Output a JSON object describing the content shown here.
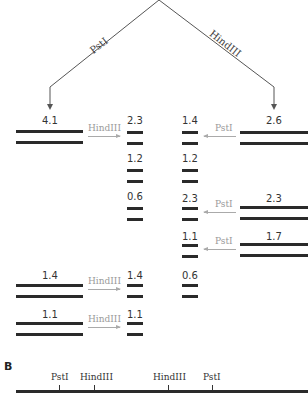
{
  "tree": {
    "left_enzyme": "PstI",
    "right_enzyme": "HindIII"
  },
  "left_panel": {
    "rows": [
      {
        "size": "4.1",
        "enzyme": "HindIII",
        "products": [
          "2.3",
          "1.2",
          "0.6"
        ]
      },
      {
        "size": "1.4",
        "enzyme": "HindIII",
        "products": [
          "1.4"
        ]
      },
      {
        "size": "1.1",
        "enzyme": "HindIII",
        "products": [
          "1.1"
        ]
      }
    ]
  },
  "right_panel": {
    "rows": [
      {
        "size": "2.6",
        "enzyme": "PstI",
        "products": [
          "1.4",
          "1.2"
        ]
      },
      {
        "size": "2.3",
        "enzyme": "PstI",
        "products": [
          "2.3"
        ]
      },
      {
        "size": "1.7",
        "enzyme": "PstI",
        "products": [
          "1.1",
          "0.6"
        ]
      }
    ]
  },
  "map": {
    "panel_label": "B",
    "sites": [
      {
        "label": "PstI",
        "x": 59
      },
      {
        "label": "HindIII",
        "x": 94
      },
      {
        "label": "HindIII",
        "x": 168
      },
      {
        "label": "PstI",
        "x": 212
      }
    ]
  }
}
